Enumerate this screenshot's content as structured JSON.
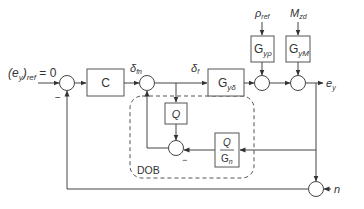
{
  "diagram": {
    "type": "block-diagram",
    "colors": {
      "line": "#444444",
      "block_border": "#555555",
      "text": "#333333",
      "background": "#ffffff"
    },
    "inputs": {
      "reference": {
        "base": "(e",
        "sub1": "y",
        "mid": ")",
        "sub2": "ref",
        "tail": " = 0"
      },
      "rho_ref": {
        "base": "ρ",
        "sub": "ref"
      },
      "M_zd": {
        "base": "M",
        "sub": "zd"
      },
      "noise": {
        "base": "n"
      }
    },
    "output": {
      "base": "e",
      "sub": "y"
    },
    "signals": {
      "delta_fn": {
        "base": "δ",
        "sub": "fn"
      },
      "delta_f": {
        "base": "δ",
        "sub": "f"
      }
    },
    "blocks": {
      "controller": {
        "label": "C"
      },
      "plant_delta": {
        "base": "G",
        "sub": "yδ"
      },
      "plant_rho": {
        "base": "G",
        "sub": "yρ"
      },
      "plant_M": {
        "base": "G",
        "sub": "yM"
      },
      "filter_Q": {
        "label": "Q"
      },
      "inverse_model": {
        "num": "Q",
        "den_base": "G",
        "den_sub": "n"
      }
    },
    "dob_group": {
      "label": "DOB"
    },
    "signs": {
      "sum1_minus": "−",
      "sum5_minus": "−"
    }
  }
}
